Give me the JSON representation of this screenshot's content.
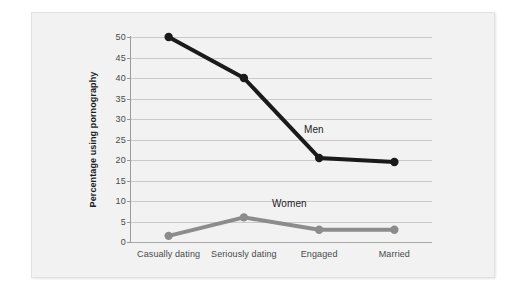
{
  "chart_data": {
    "type": "line",
    "title": "",
    "xlabel": "",
    "ylabel": "Percentage using pornography",
    "categories": [
      "Casually dating",
      "Seriously dating",
      "Engaged",
      "Married"
    ],
    "ylim": [
      0,
      50
    ],
    "ytick_labels": [
      "0",
      "5",
      "10",
      "15",
      "20",
      "25",
      "30",
      "35",
      "40",
      "45",
      "50"
    ],
    "ytick_values": [
      0,
      5,
      10,
      15,
      20,
      25,
      30,
      35,
      40,
      45,
      50
    ],
    "grid": true,
    "legend_position": "inline-annotation",
    "series": [
      {
        "name": "Men",
        "color": "#1a1a1a",
        "marker": "circle",
        "values": [
          50,
          40,
          20.5,
          19.5
        ]
      },
      {
        "name": "Women",
        "color": "#8c8c8c",
        "marker": "circle",
        "values": [
          1.5,
          6,
          3,
          3
        ]
      }
    ],
    "annotations": [
      {
        "text": "Men",
        "series": "Men"
      },
      {
        "text": "Women",
        "series": "Women"
      }
    ]
  },
  "colors": {
    "panel_background": "#f2f2f2",
    "page_background": "#ffffff",
    "gridline": "#c9c9c9",
    "axis": "#9a9a9a",
    "men_series": "#1a1a1a",
    "women_series": "#8c8c8c",
    "tick_text": "#4a4a4a",
    "axis_title_text": "#1c1c1c"
  }
}
